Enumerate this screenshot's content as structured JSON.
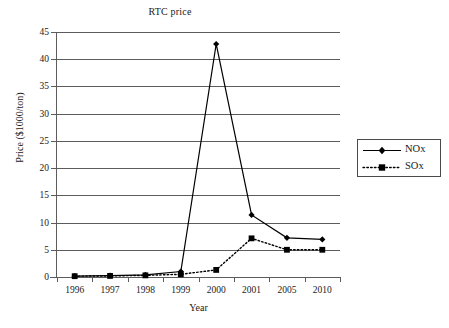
{
  "chart_data": {
    "type": "line",
    "title": "RTC price",
    "xlabel": "Year",
    "ylabel": "Price ($1000/ton)",
    "categories": [
      "1996",
      "1997",
      "1998",
      "1999",
      "2000",
      "2001",
      "2005",
      "2010"
    ],
    "ylim": [
      0,
      45
    ],
    "ytick_step": 5,
    "yticks": [
      "45",
      "40",
      "35",
      "30",
      "25",
      "20",
      "15",
      "10",
      "5",
      "0"
    ],
    "grid": "horizontal",
    "legend_position": "right",
    "series": [
      {
        "name": "NOx",
        "marker": "diamond",
        "linestyle": "solid",
        "color": "#000000",
        "values": [
          0.15,
          0.25,
          0.4,
          1.0,
          42.8,
          11.4,
          7.2,
          6.9
        ]
      },
      {
        "name": "SOx",
        "marker": "square",
        "linestyle": "dotted",
        "color": "#000000",
        "values": [
          0.15,
          0.2,
          0.3,
          0.5,
          1.3,
          7.1,
          5.0,
          5.0
        ]
      }
    ]
  },
  "legend": {
    "entries": [
      {
        "label": "NOx"
      },
      {
        "label": "SOx"
      }
    ]
  }
}
